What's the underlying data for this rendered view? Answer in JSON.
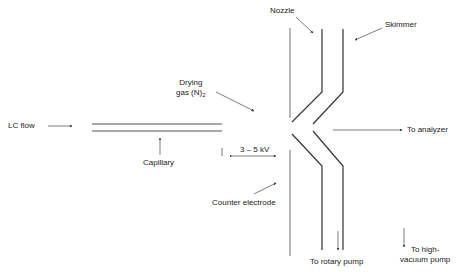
{
  "labels": {
    "lc_flow": "LC  flow",
    "capillary": "Capillary",
    "drying_gas_line1": "Drying",
    "drying_gas_line2": "gas (N)",
    "drying_gas_sub": "2",
    "voltage": "3 – 5 kV",
    "counter_electrode": "Counter electrode",
    "nozzle": "Nozzle",
    "skimmer": "Skimmer",
    "to_analyzer": "To analyzer",
    "to_rotary_pump": "To rotary pump",
    "to_high_vacuum_pump_line1": "To high-",
    "to_high_vacuum_pump_line2": "vacuum pump"
  },
  "colors": {
    "line": "#333333",
    "light_line": "#888888",
    "background": "#ffffff"
  }
}
